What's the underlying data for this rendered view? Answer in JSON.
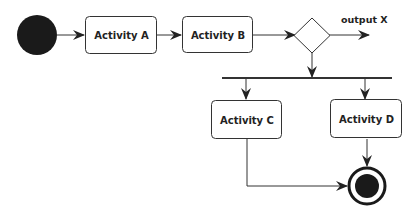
{
  "diagram": {
    "type": "uml-activity-diagram",
    "nodes": {
      "start": {
        "kind": "initial-node"
      },
      "activity_a": {
        "kind": "activity",
        "label": "Activity A"
      },
      "activity_b": {
        "kind": "activity",
        "label": "Activity B"
      },
      "decision": {
        "kind": "decision-node"
      },
      "fork": {
        "kind": "fork-bar"
      },
      "activity_c": {
        "kind": "activity",
        "label": "Activity C"
      },
      "activity_d": {
        "kind": "activity",
        "label": "Activity D"
      },
      "end": {
        "kind": "final-node"
      }
    },
    "edges": [
      {
        "from": "start",
        "to": "activity_a"
      },
      {
        "from": "activity_a",
        "to": "activity_b"
      },
      {
        "from": "activity_b",
        "to": "decision"
      },
      {
        "from": "decision",
        "to": "output",
        "label": "output X"
      },
      {
        "from": "decision",
        "to": "fork"
      },
      {
        "from": "fork",
        "to": "activity_c"
      },
      {
        "from": "fork",
        "to": "activity_d"
      },
      {
        "from": "activity_c",
        "to": "end"
      },
      {
        "from": "activity_d",
        "to": "end"
      }
    ],
    "edge_labels": {
      "output_x": "output X"
    },
    "colors": {
      "stroke": "#333333",
      "fill_dark": "#1a1a1a",
      "box_fill": "#ffffff"
    }
  }
}
